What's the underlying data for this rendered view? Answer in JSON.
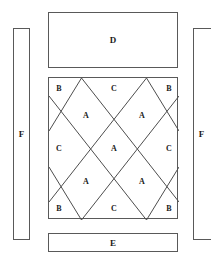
{
  "diagram": {
    "stroke_color": "#595959",
    "diagonal_color": "#4d4d4d",
    "background_color": "#ffffff",
    "text_color": "#1a1a1a"
  },
  "panels": {
    "top": {
      "label": "D",
      "name": "panel-d"
    },
    "bottom": {
      "label": "E",
      "name": "panel-e"
    },
    "left": {
      "label": "F",
      "name": "panel-f-left"
    },
    "right": {
      "label": "F",
      "name": "panel-f-right"
    }
  },
  "tile_grid": {
    "name": "tile-square",
    "cells": [
      {
        "label": "B",
        "x": 10,
        "y": 11,
        "region": "corner-top-left"
      },
      {
        "label": "C",
        "x": 65,
        "y": 11,
        "region": "edge-top-center"
      },
      {
        "label": "B",
        "x": 120,
        "y": 11,
        "region": "corner-top-right"
      },
      {
        "label": "A",
        "x": 37,
        "y": 38,
        "region": "diamond-top-left"
      },
      {
        "label": "A",
        "x": 93,
        "y": 38,
        "region": "diamond-top-right"
      },
      {
        "label": "C",
        "x": 10,
        "y": 71,
        "region": "edge-left-middle"
      },
      {
        "label": "A",
        "x": 65,
        "y": 71,
        "region": "diamond-center"
      },
      {
        "label": "C",
        "x": 120,
        "y": 71,
        "region": "edge-right-middle"
      },
      {
        "label": "A",
        "x": 37,
        "y": 104,
        "region": "diamond-bottom-left"
      },
      {
        "label": "A",
        "x": 93,
        "y": 104,
        "region": "diamond-bottom-right"
      },
      {
        "label": "B",
        "x": 10,
        "y": 131,
        "region": "corner-bottom-left"
      },
      {
        "label": "C",
        "x": 65,
        "y": 131,
        "region": "edge-bottom-center"
      },
      {
        "label": "B",
        "x": 120,
        "y": 131,
        "region": "corner-bottom-right"
      }
    ]
  }
}
